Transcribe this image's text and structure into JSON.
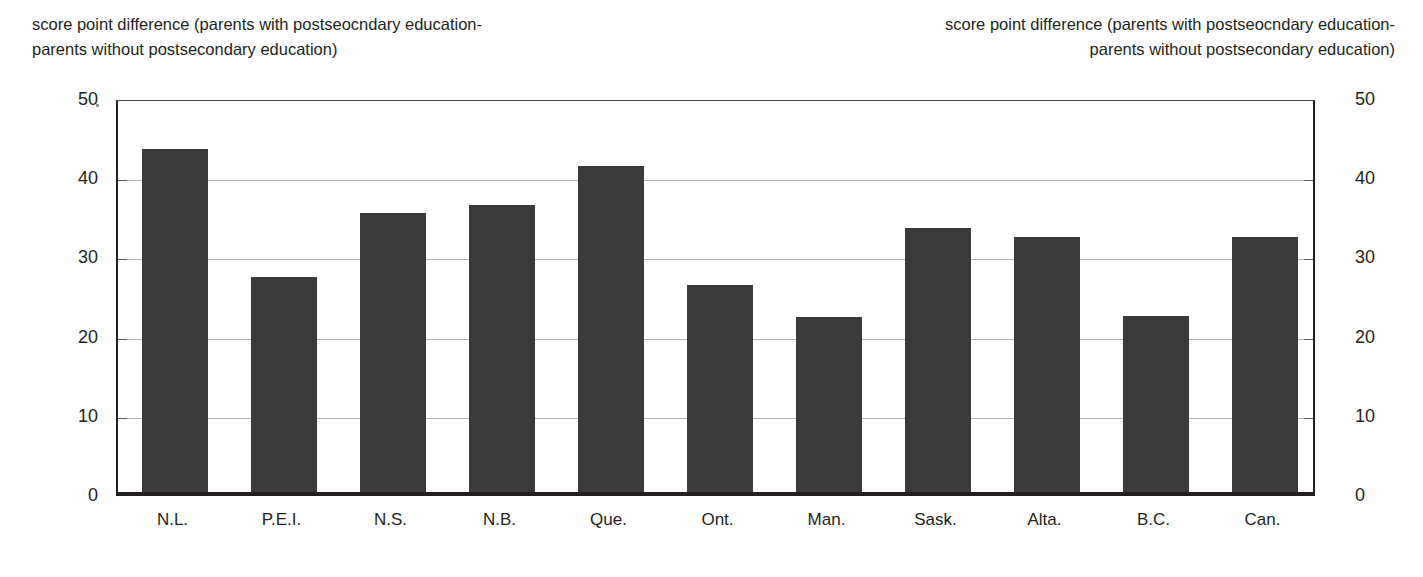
{
  "captions": {
    "left": "score point difference (parents with postseocndary education-\nparents without postsecondary education)",
    "right": "score point difference (parents with postseocndary education-\nparents without postsecondary education)"
  },
  "colors": {
    "bar": "#3a3a3a",
    "axis": "#231f20",
    "gridline": "#b5b5b5",
    "background": "#ffffff"
  },
  "chart_data": {
    "type": "bar",
    "title": "",
    "subtitle": "",
    "xlabel": "",
    "ylabel": "score point difference (parents with postseocndary education-parents without postsecondary education)",
    "ylabel_right": "score point difference (parents with postseocndary education-parents without postsecondary education)",
    "categories": [
      "N.L.",
      "P.E.I.",
      "N.S.",
      "N.B.",
      "Que.",
      "Ont.",
      "Man.",
      "Sask.",
      "Alta.",
      "B.C.",
      "Can."
    ],
    "values": [
      43.3,
      27.1,
      35.2,
      36.3,
      41.2,
      26.1,
      22.1,
      33.3,
      32.2,
      22.2,
      32.2
    ],
    "ylim": [
      0,
      50
    ],
    "yticks": [
      0,
      10,
      20,
      30,
      40,
      50
    ],
    "ytick_labels_left": [
      "0",
      "10",
      "20",
      "30",
      "40",
      "50"
    ],
    "ytick_labels_right": [
      "0",
      "10",
      "20",
      "30",
      "40",
      "50"
    ],
    "grid": true,
    "legend": false,
    "legend_position": "none",
    "series": [
      {
        "name": "score point difference",
        "values": [
          43.3,
          27.1,
          35.2,
          36.3,
          41.2,
          26.1,
          22.1,
          33.3,
          32.2,
          22.2,
          32.2
        ]
      }
    ]
  }
}
